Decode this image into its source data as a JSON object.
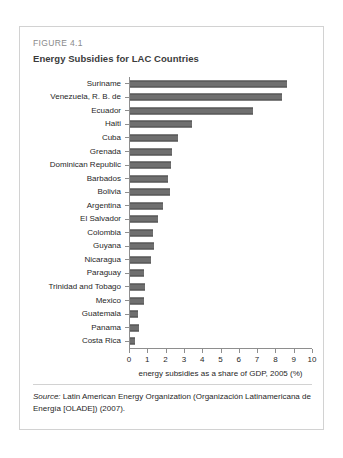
{
  "figure": {
    "number_label": "FIGURE 4.1",
    "title": "Energy Subsidies for LAC Countries",
    "source_prefix": "Source:",
    "source_text": " Latin American Energy Organization (Organización Latinamericana de Energía [OLADE]) (2007)."
  },
  "chart_data": {
    "type": "bar",
    "orientation": "horizontal",
    "title": "Energy Subsidies for LAC Countries",
    "xlabel": "energy subsidies as a share of GDP, 2005 (%)",
    "ylabel": "",
    "xlim": [
      0,
      10
    ],
    "xticks": [
      0,
      1,
      2,
      3,
      4,
      5,
      6,
      7,
      8,
      9,
      10
    ],
    "xtick_labels": [
      "0",
      "1",
      "2",
      "3",
      "4",
      "5",
      "6",
      "7",
      "8",
      "9",
      "10"
    ],
    "grid": false,
    "legend": null,
    "bar_color": "#6f6f6f",
    "categories": [
      "Suriname",
      "Venezuela, R. B. de",
      "Ecuador",
      "Haiti",
      "Cuba",
      "Grenada",
      "Dominican Republic",
      "Barbados",
      "Bolivia",
      "Argentina",
      "El Salvador",
      "Colombia",
      "Guyana",
      "Nicaragua",
      "Paraguay",
      "Trinidad and Tobago",
      "Mexico",
      "Guatemala",
      "Panama",
      "Costa Rica"
    ],
    "values": [
      8.6,
      8.3,
      6.7,
      3.4,
      2.6,
      2.3,
      2.25,
      2.05,
      2.2,
      1.8,
      1.55,
      1.25,
      1.3,
      1.15,
      0.75,
      0.8,
      0.75,
      0.42,
      0.48,
      0.25
    ]
  }
}
